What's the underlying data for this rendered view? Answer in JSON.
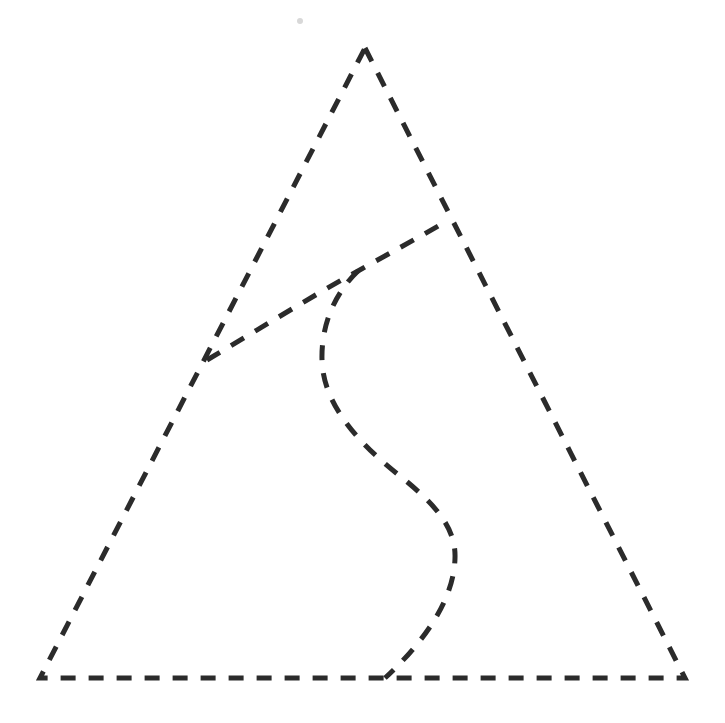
{
  "canvas": {
    "width": 725,
    "height": 723,
    "background_color": "#ffffff",
    "title": "Dashed outline drawing: triangle with interior curves"
  },
  "style": {
    "stroke_color": "#2b2b2b",
    "stroke_width": 5,
    "dash_on": 15,
    "dash_off": 13,
    "dash_array": "15 13",
    "line_cap": "butt",
    "artifact_dot_color": "#d8d8d8"
  },
  "chart_data": {
    "type": "diagram",
    "xlabel": "",
    "ylabel": "",
    "xlim": [
      0,
      725
    ],
    "ylim": [
      0,
      723
    ],
    "grid": false,
    "legend": "none",
    "annotations": [],
    "vertices": {
      "apex": [
        365,
        48
      ],
      "bottom_left": [
        40,
        678
      ],
      "bottom_right": [
        685,
        678
      ],
      "left_edge_junction": [
        207,
        360
      ],
      "right_edge_junction": [
        445,
        222
      ],
      "branch_point": [
        358,
        271
      ],
      "curve_base_end": [
        385,
        678
      ]
    },
    "series": [
      {
        "name": "triangle-outline",
        "kind": "polygon",
        "closed": true,
        "points": [
          [
            365,
            48
          ],
          [
            685,
            678
          ],
          [
            40,
            678
          ]
        ]
      },
      {
        "name": "upper-arc",
        "kind": "curve",
        "closed": false,
        "points": [
          [
            207,
            360
          ],
          [
            268,
            323
          ],
          [
            316,
            292
          ],
          [
            358,
            271
          ],
          [
            400,
            248
          ],
          [
            445,
            222
          ]
        ]
      },
      {
        "name": "inner-s-curve",
        "kind": "curve",
        "closed": false,
        "points": [
          [
            358,
            271
          ],
          [
            335,
            296
          ],
          [
            323,
            330
          ],
          [
            322,
            360
          ],
          [
            340,
            412
          ],
          [
            372,
            455
          ],
          [
            412,
            488
          ],
          [
            440,
            515
          ],
          [
            455,
            545
          ],
          [
            452,
            585
          ],
          [
            432,
            622
          ],
          [
            406,
            652
          ],
          [
            385,
            678
          ]
        ]
      }
    ]
  },
  "paths": {
    "triangle": "M 365 48 L 685 678 L 40 678 Z",
    "upper_arc": "M 207 360 C 258 330, 310 297, 358 271 C 388 254, 418 238, 445 222",
    "inner_s_curve": "M 358 271 C 334 294, 321 326, 322 360 C 323 404, 358 443, 400 476 C 436 505, 456 528, 455 558 C 454 600, 424 642, 385 678"
  },
  "artifact": {
    "name": "stray-dot",
    "cx": 300,
    "cy": 21,
    "r": 3
  }
}
